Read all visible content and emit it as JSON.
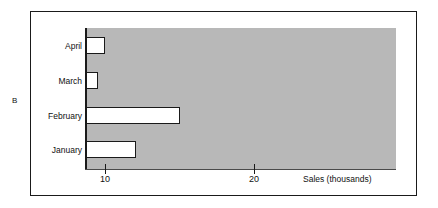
{
  "figure": {
    "group_label": "B",
    "colors": {
      "plot_background": "#b8b8b8",
      "bar_fill": "#ffffff",
      "bar_edge": "#1a1a1a",
      "frame": "#1a1a1a",
      "page_background": "#ffffff"
    }
  },
  "chart_data": {
    "type": "bar",
    "orientation": "horizontal",
    "title": "",
    "subtitle": "",
    "xlabel": "Sales (thousands)",
    "ylabel": "",
    "categories": [
      "January",
      "February",
      "March",
      "April"
    ],
    "values": [
      12.1,
      15.0,
      9.5,
      10.0
    ],
    "series": [
      {
        "name": "Sales",
        "values": [
          12.1,
          15.0,
          9.5,
          10.0
        ]
      }
    ],
    "xlim": [
      8.7,
      29.5
    ],
    "xticks": [
      10,
      20
    ],
    "xtick_labels": [
      "10",
      "20"
    ],
    "ytick_labels": [
      "January",
      "February",
      "March",
      "April"
    ],
    "grid": false,
    "legend": false,
    "legend_position": "none",
    "annotations": [
      {
        "text": "B",
        "role": "panel-group-label",
        "position": "outer-left"
      }
    ]
  }
}
